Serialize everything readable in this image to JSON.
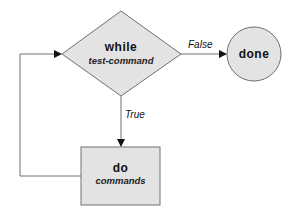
{
  "diagram": {
    "decision": {
      "keyword": "while",
      "condition": "test-command"
    },
    "terminal": {
      "label": "done"
    },
    "process": {
      "keyword": "do",
      "body": "commands"
    },
    "edges": {
      "false_label": "False",
      "true_label": "True"
    },
    "colors": {
      "shape_fill": "#e3e3e3",
      "stroke": "#707070",
      "arrow": "#111111"
    }
  }
}
